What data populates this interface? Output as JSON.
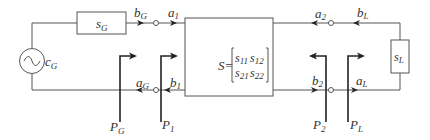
{
  "diagram": {
    "type": "two-port network signal flow",
    "generator": {
      "source_label": "c",
      "source_sub": "G",
      "impedance_label": "s",
      "impedance_sub": "G"
    },
    "load": {
      "label": "s",
      "sub": "L"
    },
    "network": {
      "prefix": "S=",
      "matrix": [
        [
          "s11",
          "s12"
        ],
        [
          "s21",
          "s22"
        ]
      ],
      "m11": "s",
      "m11_sub": "11",
      "m12": "s",
      "m12_sub": "12",
      "m21": "s",
      "m21_sub": "21",
      "m22": "s",
      "m22_sub": "22"
    },
    "waves": {
      "bG": {
        "main": "b",
        "sub": "G"
      },
      "a1": {
        "main": "a",
        "sub": "1"
      },
      "aG": {
        "main": "a",
        "sub": "G"
      },
      "b1": {
        "main": "b",
        "sub": "1"
      },
      "a2": {
        "main": "a",
        "sub": "2"
      },
      "bL": {
        "main": "b",
        "sub": "L"
      },
      "b2": {
        "main": "b",
        "sub": "2"
      },
      "aL": {
        "main": "a",
        "sub": "L"
      }
    },
    "reference_planes": {
      "PG": {
        "main": "P",
        "sub": "G"
      },
      "P1": {
        "main": "P",
        "sub": "1"
      },
      "P2": {
        "main": "P",
        "sub": "2"
      },
      "PL": {
        "main": "P",
        "sub": "L"
      }
    },
    "colors": {
      "wire": "#555555",
      "plane": "#222222",
      "text": "#333333"
    }
  }
}
